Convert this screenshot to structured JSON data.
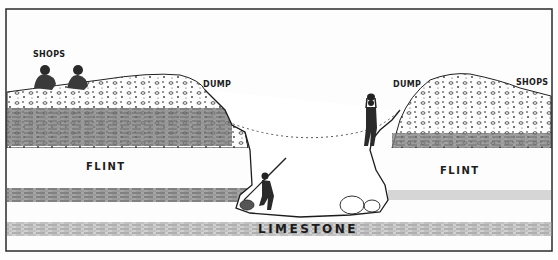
{
  "diagram": {
    "type": "cross-section illustration",
    "labels": {
      "shops_left": "SHOPS",
      "dump_left": "DUMP",
      "dump_right": "DUMP",
      "shops_right": "SHOPS",
      "flint_left": "FLINT",
      "flint_right": "FLINT",
      "limestone": "LIMESTONE"
    },
    "figures": [
      {
        "name": "seated-worker-1",
        "location": "left shops"
      },
      {
        "name": "seated-worker-2",
        "location": "left shops"
      },
      {
        "name": "miner-with-pick",
        "location": "shaft bottom"
      },
      {
        "name": "worker-lifting-basket",
        "location": "right shaft rim"
      }
    ],
    "colors": {
      "ink": "#1c1c1c",
      "paper": "#fdfdfd",
      "shade": "#6a6a6a"
    }
  }
}
